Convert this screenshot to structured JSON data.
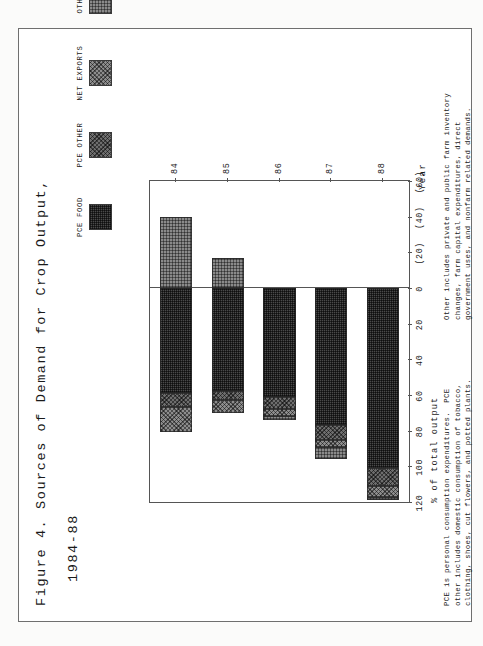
{
  "document": {
    "title_line1": "Figure 4. Sources of Demand for Crop Output,",
    "title_line2": "1984-88"
  },
  "legend": {
    "items": [
      {
        "label": "PCE FOOD",
        "pattern": "fill-pcefood",
        "color": "#4a4a4a"
      },
      {
        "label": "PCE OTHER",
        "pattern": "fill-pceother",
        "color": "#6e6e6e"
      },
      {
        "label": "NET EXPORTS",
        "pattern": "fill-netexports",
        "color": "#8d8d8d"
      },
      {
        "label": "OTHER",
        "pattern": "fill-other",
        "color": "#8a8a8a"
      }
    ]
  },
  "axes": {
    "value_axis_title": "% of total output",
    "value_ticks": [
      "120",
      "100",
      "80",
      "60",
      "40",
      "20",
      "0",
      "(20)",
      "(40)",
      "(60)"
    ],
    "category_axis_title": "Year",
    "category_ticks": [
      "84",
      "85",
      "86",
      "87",
      "88"
    ]
  },
  "footnotes": {
    "left": "PCE is personal consumption expenditures.  PCE\nother includes domestic consumption of tobacco,\nclothing, shoes, cut flowers, and potted plants.",
    "right": "Other includes private and public farm inventory\nchanges, farm capital expenditures, direct\ngovernment uses, and nonfarm related demands."
  },
  "chart_data": {
    "type": "bar",
    "title": "Figure 4. Sources of Demand for Crop Output, 1984-88",
    "xlabel": "Year",
    "ylabel": "% of total output",
    "ylim": [
      -60,
      120
    ],
    "grid": false,
    "legend_position": "top",
    "orientation": "vertical-stacked",
    "categories": [
      "84",
      "85",
      "86",
      "87",
      "88"
    ],
    "series": [
      {
        "name": "PCE FOOD",
        "values": [
          59,
          58,
          61,
          77,
          101
        ]
      },
      {
        "name": "PCE OTHER",
        "values": [
          8,
          5,
          7,
          8,
          10
        ]
      },
      {
        "name": "NET EXPORTS",
        "values": [
          14,
          7,
          4,
          4,
          6
        ]
      },
      {
        "name": "OTHER",
        "values": [
          -40,
          -17,
          2,
          7,
          2
        ]
      }
    ]
  }
}
